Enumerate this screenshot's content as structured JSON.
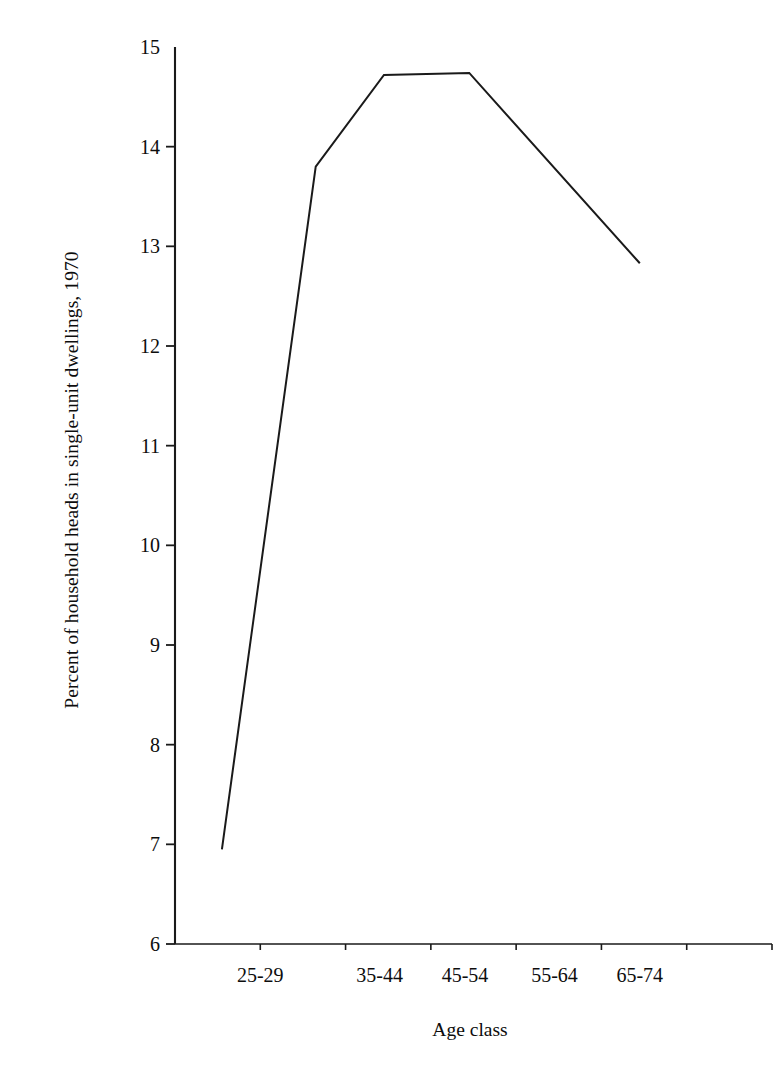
{
  "chart_data": {
    "type": "line",
    "title": "",
    "subtitle": "",
    "xlabel": "Age class",
    "ylabel": "Percent of household heads in single-unit dwellings, 1970",
    "categories": [
      "25-29",
      "35-44",
      "45-54",
      "55-64",
      "65-74"
    ],
    "x_tick_labels": [
      "25-29",
      "35-44",
      "45-54",
      "55-64",
      "65-74"
    ],
    "y_tick_labels": [
      "6",
      "7",
      "8",
      "9",
      "10",
      "11",
      "12",
      "13",
      "14",
      "15"
    ],
    "y_ticks": [
      6,
      7,
      8,
      9,
      10,
      11,
      12,
      13,
      14,
      15
    ],
    "ylim": [
      6,
      15
    ],
    "xlim": [
      0,
      7
    ],
    "grid": false,
    "legend": null,
    "series": [
      {
        "name": "Percent of household heads in single-unit dwellings, 1970",
        "color": "#1a1a1a",
        "x": [
          0.55,
          1.65,
          2.45,
          3.45,
          5.45
        ],
        "values": [
          6.95,
          13.8,
          14.72,
          14.74,
          12.83
        ]
      }
    ],
    "annotations": []
  },
  "axis": {
    "y_label_text": "Percent of household heads in single-unit dwellings, 1970",
    "x_label_text": "Age class"
  }
}
